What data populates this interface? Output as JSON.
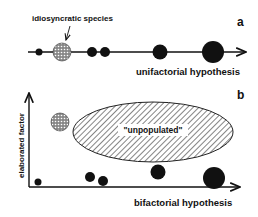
{
  "panel_a": {
    "letter": "a",
    "annotation": "idiosyncratic species",
    "axis_label": "unifactorial hypothesis"
  },
  "panel_b": {
    "letter": "b",
    "x_axis_label": "bifactorial hypothesis",
    "y_axis_label": "elaborated factor",
    "region_label": "\"unpopulated\""
  }
}
